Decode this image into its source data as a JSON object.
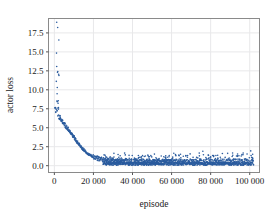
{
  "chart_data": {
    "type": "scatter",
    "title": "",
    "xlabel": "episode",
    "ylabel": "actor loss",
    "xlim": [
      -3000,
      105000
    ],
    "ylim": [
      -0.9,
      19.4
    ],
    "grid": true,
    "legend": null,
    "marker": {
      "color": "#2b5c9e",
      "size": 1.6,
      "shape": "circle"
    },
    "xticks": [
      0,
      20000,
      40000,
      60000,
      80000,
      100000
    ],
    "xticklabels": [
      "0",
      "20 000",
      "40 000",
      "60 000",
      "80 000",
      "100 000"
    ],
    "yticks": [
      0.0,
      2.5,
      5.0,
      7.5,
      10.0,
      12.5,
      15.0,
      17.5
    ],
    "yticklabels": [
      "0.0",
      "2.5",
      "5.0",
      "7.5",
      "10.0",
      "12.5",
      "15.0",
      "17.5"
    ],
    "series": [
      {
        "name": "actor loss",
        "points": [
          [
            1200,
            18.7
          ],
          [
            1700,
            17.9
          ],
          [
            2300,
            16.9
          ],
          [
            1500,
            10.6
          ],
          [
            1900,
            8.5
          ],
          [
            2100,
            7.8
          ],
          [
            300,
            7.4
          ],
          [
            600,
            7.3
          ],
          [
            900,
            7.25
          ],
          [
            1200,
            7.1
          ],
          [
            1500,
            6.95
          ],
          [
            1800,
            6.8
          ],
          [
            2100,
            6.6
          ],
          [
            2400,
            6.45
          ],
          [
            2700,
            6.3
          ],
          [
            3000,
            6.15
          ],
          [
            3300,
            6.0
          ],
          [
            3600,
            5.9
          ],
          [
            3900,
            5.78
          ],
          [
            4200,
            5.68
          ],
          [
            4500,
            5.6
          ],
          [
            4800,
            5.5
          ],
          [
            5100,
            5.4
          ],
          [
            5400,
            5.32
          ],
          [
            5700,
            5.2
          ],
          [
            6000,
            5.1
          ],
          [
            6300,
            5.02
          ],
          [
            6600,
            4.92
          ],
          [
            6900,
            4.82
          ],
          [
            7200,
            4.72
          ],
          [
            7500,
            4.62
          ],
          [
            7800,
            4.52
          ],
          [
            8100,
            4.42
          ],
          [
            8400,
            4.3
          ],
          [
            8700,
            4.2
          ],
          [
            9000,
            4.1
          ],
          [
            9300,
            3.98
          ],
          [
            9600,
            3.88
          ],
          [
            9900,
            3.76
          ],
          [
            10200,
            3.65
          ],
          [
            10500,
            3.54
          ],
          [
            10800,
            3.43
          ],
          [
            11100,
            3.32
          ],
          [
            11400,
            3.2
          ],
          [
            11700,
            3.1
          ],
          [
            12000,
            3.0
          ],
          [
            12300,
            2.9
          ],
          [
            12600,
            2.8
          ],
          [
            12900,
            2.7
          ],
          [
            13200,
            2.6
          ],
          [
            13500,
            2.5
          ],
          [
            13800,
            2.42
          ],
          [
            14100,
            2.33
          ],
          [
            14400,
            2.24
          ],
          [
            14700,
            2.16
          ],
          [
            15000,
            2.08
          ],
          [
            15300,
            2.0
          ],
          [
            15600,
            1.93
          ],
          [
            15900,
            1.86
          ],
          [
            16200,
            1.79
          ],
          [
            16500,
            1.72
          ],
          [
            16800,
            1.66
          ],
          [
            17100,
            1.6
          ],
          [
            17400,
            1.54
          ],
          [
            17700,
            1.48
          ],
          [
            18000,
            1.43
          ],
          [
            18300,
            1.38
          ],
          [
            18600,
            1.33
          ],
          [
            18900,
            1.28
          ],
          [
            19200,
            1.24
          ],
          [
            19500,
            1.2
          ],
          [
            20000,
            1.14
          ],
          [
            20500,
            1.08
          ],
          [
            21000,
            1.03
          ],
          [
            21500,
            0.98
          ],
          [
            22000,
            0.94
          ],
          [
            22500,
            0.9
          ],
          [
            23000,
            0.86
          ],
          [
            23500,
            0.83
          ],
          [
            24000,
            0.8
          ],
          [
            24500,
            0.77
          ],
          [
            25000,
            0.74
          ],
          [
            26000,
            0.7
          ],
          [
            27000,
            0.66
          ],
          [
            28000,
            0.63
          ],
          [
            29000,
            0.6
          ],
          [
            30000,
            0.58
          ],
          [
            32000,
            0.55
          ],
          [
            34000,
            0.53
          ],
          [
            36000,
            0.51
          ],
          [
            38000,
            0.5
          ],
          [
            40000,
            0.49
          ],
          [
            45000,
            0.47
          ],
          [
            50000,
            0.46
          ],
          [
            55000,
            0.45
          ],
          [
            60000,
            0.45
          ],
          [
            70000,
            0.44
          ],
          [
            80000,
            0.44
          ],
          [
            90000,
            0.43
          ],
          [
            100000,
            0.43
          ]
        ],
        "outliers_tail": [
          [
            30500,
            1.15
          ],
          [
            33000,
            1.1
          ],
          [
            36500,
            0.95
          ],
          [
            41000,
            1.0
          ],
          [
            46000,
            1.2
          ],
          [
            52000,
            1.05
          ],
          [
            57000,
            1.3
          ],
          [
            62000,
            1.45
          ],
          [
            66000,
            1.25
          ],
          [
            71000,
            1.1
          ],
          [
            76000,
            1.9
          ],
          [
            81000,
            1.35
          ],
          [
            86000,
            1.6
          ],
          [
            91000,
            1.2
          ],
          [
            96000,
            1.45
          ],
          [
            100500,
            1.95
          ],
          [
            101500,
            1.5
          ]
        ]
      }
    ]
  },
  "axes": {
    "frame_color": "#808080",
    "grid_color": "#e8e8ea",
    "tick_color": "#555555",
    "background": "#ffffff"
  }
}
